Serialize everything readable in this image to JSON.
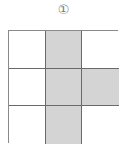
{
  "figure": {
    "label": "①",
    "rows": 3,
    "cols": 3,
    "cells": [
      {
        "row": 1,
        "col": 1,
        "shaded": false
      },
      {
        "row": 1,
        "col": 2,
        "shaded": true
      },
      {
        "row": 1,
        "col": 3,
        "shaded": false
      },
      {
        "row": 2,
        "col": 1,
        "shaded": false
      },
      {
        "row": 2,
        "col": 2,
        "shaded": true
      },
      {
        "row": 2,
        "col": 3,
        "shaded": true
      },
      {
        "row": 3,
        "col": 1,
        "shaded": false
      },
      {
        "row": 3,
        "col": 2,
        "shaded": true
      },
      {
        "row": 3,
        "col": 3,
        "shaded": false
      }
    ],
    "colors": {
      "shaded": "#d4d4d4",
      "empty": "#ffffff",
      "border": "#6a6a6a"
    }
  }
}
